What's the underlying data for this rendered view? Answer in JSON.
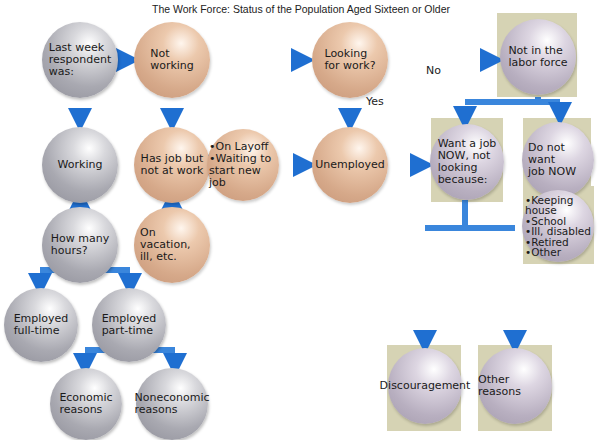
{
  "title": "The Work Force: Status of the Population Aged Sixteen or Older",
  "colors": {
    "arrow": "#1f6fd1",
    "box_bg": "#d6d3b4",
    "working_nodes": "#a9a9b1",
    "not_working_nodes": "#d6a98a",
    "not_in_labor_force_nodes": "#b8afc0"
  },
  "nodes": {
    "respondent": "Last week\nrespondent\nwas:",
    "not_working": "Not\nworking",
    "looking": "Looking\nfor work?",
    "not_in_labor_force": "Not in the\nlabor force",
    "working": "Working",
    "has_job_not_at_work": "Has job but\nnot at work",
    "layoff": "•On Layoff\n•Waiting to\nstart new job",
    "unemployed": "Unemployed",
    "want_job": "Want a job\nNOW, not\nlooking\nbecause:",
    "do_not_want": "Do not want\njob NOW",
    "reasons_list": "•Keeping\n  house\n•School\n•Ill, disabled\n•Retired\n•Other",
    "how_many_hours": "How many\nhours?",
    "vacation": "On vacation,\nill, etc.",
    "full_time": "Employed\nfull-time",
    "part_time": "Employed\npart-time",
    "economic": "Economic\nreasons",
    "noneconomic": "Noneconomic\nreasons",
    "discouragement": "Discouragement",
    "other_reasons": "Other reasons"
  },
  "edge_labels": {
    "no": "No",
    "yes": "Yes"
  }
}
